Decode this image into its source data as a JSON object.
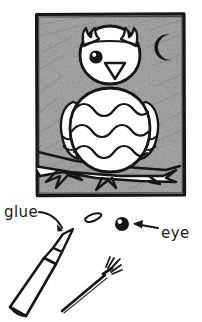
{
  "illustration": {
    "title": "Owl craft picture with materials",
    "style": "hand-drawn pencil sketch",
    "ink_color": "#141414",
    "paper_color": "#ffffff",
    "shading_color": "#9a9a9a"
  },
  "framed_picture": {
    "name": "owl-picture-frame",
    "border_color": "#141414",
    "background_color": "#a8a8a8",
    "contents": {
      "owl": {
        "name": "owl-drawing",
        "body_color": "#ffffff",
        "outline_color": "#141414",
        "features": [
          "ear-tufts",
          "left-eye",
          "beak",
          "wings",
          "scalloped-feathers"
        ],
        "feather_rows": 3
      },
      "moon": {
        "name": "crescent-moon",
        "shape": "crescent",
        "color": "#141414"
      },
      "branch": {
        "name": "tree-branch",
        "color": "#141414",
        "twigs": 2
      }
    }
  },
  "materials": [
    {
      "id": "glue",
      "label": "glue",
      "item_name": "glue-bottle",
      "arrow": "curved-arrow-down-right"
    },
    {
      "id": "eye",
      "label": "eye",
      "item_name": "googly-eye-bead",
      "color": "#141414",
      "arrow": "straight-arrow-left"
    }
  ],
  "extras": {
    "glue_drop": {
      "name": "glue-drop",
      "label": ""
    },
    "paintbrush": {
      "name": "paintbrush",
      "label": ""
    }
  }
}
